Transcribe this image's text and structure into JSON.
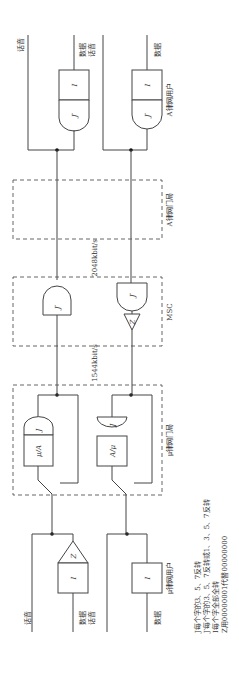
{
  "diagram": {
    "orientation": "rotated 90 degrees (text reads bottom-to-top)",
    "top_side": {
      "left_user": {
        "voice_label": "话音",
        "data_voice_label": "数据\n话音",
        "data_label": "数据",
        "data_label2": "话音"
      },
      "right_user": {
        "data_label": "数据",
        "user_label": "A律网用户"
      },
      "gates_left": [
        "I",
        "J′"
      ],
      "gates_right": [
        "I",
        "J′"
      ]
    },
    "a_law_office": {
      "label": "A律网门局"
    },
    "rate_top": "2048kbit/s",
    "msc": {
      "label": "MSC",
      "gates_left": [
        "J′"
      ],
      "gates_right": [
        "J′",
        "Z"
      ]
    },
    "rate_bottom": "1544kbit/s",
    "mu_law_office": {
      "label": "μ律网门局",
      "left_gates": [
        "J",
        "μ/A"
      ],
      "right_gates": [
        "J",
        "A/μ"
      ]
    },
    "bottom_side": {
      "left_user": {
        "voice_label": "话音",
        "data_label": "数据",
        "data_label2": "话音",
        "gates": [
          "Z",
          "I"
        ]
      },
      "right_user": {
        "data_label": "数据",
        "user_label": "μ律网用户",
        "gates": [
          "I"
        ]
      }
    },
    "legend": [
      "J每个字的3、5、7反转",
      "J′每个字的3、5、7反转或1、3、5、7反转",
      "I每个字全部全转",
      "Z用00000001代替00000000"
    ]
  }
}
